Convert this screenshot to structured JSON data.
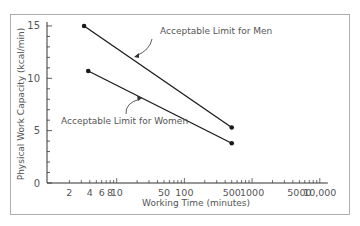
{
  "chart_data": {
    "type": "line",
    "title": "",
    "xlabel": "Working Time (minutes)",
    "ylabel": "Physical Work Capacity (kcal/min)",
    "xscale": "log",
    "xlim": [
      1,
      10000
    ],
    "ylim": [
      0,
      15
    ],
    "x_tick_labels": [
      "2",
      "4",
      "6",
      "8",
      "10",
      "50",
      "100",
      "500",
      "1000",
      "5000",
      "10,000"
    ],
    "x_tick_values": [
      2,
      4,
      6,
      8,
      10,
      50,
      100,
      500,
      1000,
      5000,
      10000
    ],
    "y_tick_labels": [
      "0",
      "5",
      "10",
      "15"
    ],
    "y_tick_values": [
      0,
      5,
      10,
      15
    ],
    "grid": false,
    "series": [
      {
        "name": "Acceptable Limit for Men",
        "x": [
          3.3,
          500
        ],
        "y": [
          15,
          5.3
        ]
      },
      {
        "name": "Acceptable Limit for Women",
        "x": [
          3.8,
          500
        ],
        "y": [
          10.7,
          3.8
        ]
      }
    ],
    "annotations": [
      {
        "text": "Acceptable Limit for Men",
        "target_series": 0
      },
      {
        "text": "Acceptable Limit for Women",
        "target_series": 1
      }
    ]
  },
  "colors": {
    "line": "#1a1a1a",
    "axis": "#333333",
    "text": "#555555",
    "frame": "#888888"
  }
}
